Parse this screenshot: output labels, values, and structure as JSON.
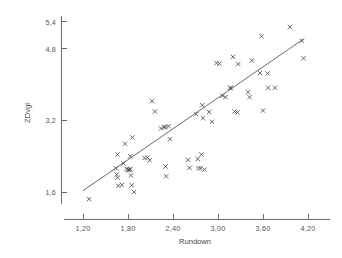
{
  "chart_data": {
    "type": "scatter",
    "title": "",
    "xlabel": "Rundown",
    "ylabel": "ZDvgl",
    "xlim": [
      1.05,
      4.45
    ],
    "ylim": [
      1.25,
      5.65
    ],
    "xticks": [
      "1,20",
      "1,80",
      "2,40",
      "3,00",
      "3,60",
      "4,20"
    ],
    "xtick_values": [
      1.2,
      1.8,
      2.4,
      3.0,
      3.6,
      4.2
    ],
    "yticks": [
      "5,4",
      "4,8",
      "3,2",
      "1,6"
    ],
    "ytick_values": [
      5.4,
      4.8,
      3.2,
      1.6
    ],
    "grid": false,
    "legend": "none",
    "marker": "x",
    "marker_color": "#4f4f4f",
    "axis_color": "#6b6b6b",
    "fit_line": {
      "label": "regression line",
      "x_start": 1.2,
      "y_start": 1.63,
      "x_end": 4.14,
      "y_end": 5.02,
      "color": "#5a5a5a"
    },
    "points": [
      [
        1.28,
        1.44
      ],
      [
        1.64,
        2.13
      ],
      [
        1.65,
        1.99
      ],
      [
        1.66,
        1.92
      ],
      [
        1.66,
        2.44
      ],
      [
        1.67,
        1.74
      ],
      [
        1.72,
        1.76
      ],
      [
        1.74,
        2.24
      ],
      [
        1.76,
        2.68
      ],
      [
        1.78,
        2.12
      ],
      [
        1.8,
        2.1
      ],
      [
        1.81,
        2.09
      ],
      [
        1.82,
        2.09
      ],
      [
        1.83,
        2.4
      ],
      [
        1.83,
        2.11
      ],
      [
        1.84,
        1.97
      ],
      [
        1.85,
        1.75
      ],
      [
        1.86,
        2.82
      ],
      [
        1.88,
        1.6
      ],
      [
        2.02,
        2.36
      ],
      [
        2.06,
        2.37
      ],
      [
        2.09,
        2.31
      ],
      [
        2.12,
        3.63
      ],
      [
        2.16,
        3.4
      ],
      [
        2.24,
        3.02
      ],
      [
        2.28,
        3.05
      ],
      [
        2.3,
        3.05
      ],
      [
        2.3,
        2.17
      ],
      [
        2.31,
        1.95
      ],
      [
        2.34,
        3.07
      ],
      [
        2.36,
        2.78
      ],
      [
        2.6,
        2.32
      ],
      [
        2.62,
        2.14
      ],
      [
        2.71,
        3.34
      ],
      [
        2.73,
        2.34
      ],
      [
        2.74,
        2.13
      ],
      [
        2.77,
        2.13
      ],
      [
        2.78,
        2.44
      ],
      [
        2.79,
        3.54
      ],
      [
        2.8,
        3.25
      ],
      [
        2.82,
        2.1
      ],
      [
        2.88,
        3.39
      ],
      [
        2.92,
        3.17
      ],
      [
        2.98,
        4.48
      ],
      [
        3.02,
        4.47
      ],
      [
        3.06,
        3.75
      ],
      [
        3.1,
        3.72
      ],
      [
        3.16,
        3.93
      ],
      [
        3.17,
        3.92
      ],
      [
        3.2,
        4.62
      ],
      [
        3.22,
        3.4
      ],
      [
        3.26,
        3.38
      ],
      [
        3.27,
        4.46
      ],
      [
        3.4,
        3.83
      ],
      [
        3.42,
        3.72
      ],
      [
        3.45,
        4.54
      ],
      [
        3.56,
        4.26
      ],
      [
        3.58,
        5.08
      ],
      [
        3.6,
        3.42
      ],
      [
        3.66,
        4.25
      ],
      [
        3.67,
        3.93
      ],
      [
        3.76,
        3.93
      ],
      [
        3.96,
        5.29
      ],
      [
        4.12,
        4.98
      ],
      [
        4.14,
        4.59
      ]
    ]
  }
}
